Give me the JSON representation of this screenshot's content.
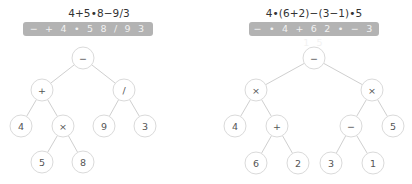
{
  "trees": [
    {
      "id": "left",
      "infix": "4+5•8−9/3",
      "prefix": "− + 4 • 5 8 / 9 3",
      "nodes": [
        {
          "id": "n0",
          "label": "−",
          "x": 83,
          "y": 58
        },
        {
          "id": "n1",
          "label": "+",
          "x": 42,
          "y": 90
        },
        {
          "id": "n2",
          "label": "/",
          "x": 124,
          "y": 90
        },
        {
          "id": "n3",
          "label": "4",
          "x": 21,
          "y": 126
        },
        {
          "id": "n4",
          "label": "×",
          "x": 63,
          "y": 126
        },
        {
          "id": "n5",
          "label": "9",
          "x": 104,
          "y": 126
        },
        {
          "id": "n6",
          "label": "3",
          "x": 145,
          "y": 126
        },
        {
          "id": "n7",
          "label": "5",
          "x": 42,
          "y": 162
        },
        {
          "id": "n8",
          "label": "8",
          "x": 83,
          "y": 162
        }
      ],
      "edges": [
        [
          "n0",
          "n1"
        ],
        [
          "n0",
          "n2"
        ],
        [
          "n1",
          "n3"
        ],
        [
          "n1",
          "n4"
        ],
        [
          "n2",
          "n5"
        ],
        [
          "n2",
          "n6"
        ],
        [
          "n4",
          "n7"
        ],
        [
          "n4",
          "n8"
        ]
      ]
    },
    {
      "id": "right",
      "infix": "4•(6+2)−(3−1)•5",
      "prefix": "− • 4 + 6 2 • − 3 1 5",
      "nodes": [
        {
          "id": "m0",
          "label": "−",
          "x": 314,
          "y": 58
        },
        {
          "id": "m1",
          "label": "×",
          "x": 256,
          "y": 90
        },
        {
          "id": "m2",
          "label": "×",
          "x": 372,
          "y": 90
        },
        {
          "id": "m3",
          "label": "4",
          "x": 235,
          "y": 126
        },
        {
          "id": "m4",
          "label": "+",
          "x": 277,
          "y": 126
        },
        {
          "id": "m5",
          "label": "−",
          "x": 351,
          "y": 126
        },
        {
          "id": "m6",
          "label": "5",
          "x": 393,
          "y": 126
        },
        {
          "id": "m7",
          "label": "6",
          "x": 256,
          "y": 163
        },
        {
          "id": "m8",
          "label": "2",
          "x": 298,
          "y": 163
        },
        {
          "id": "m9",
          "label": "3",
          "x": 331,
          "y": 163
        },
        {
          "id": "m10",
          "label": "1",
          "x": 373,
          "y": 163
        }
      ],
      "edges": [
        [
          "m0",
          "m1"
        ],
        [
          "m0",
          "m2"
        ],
        [
          "m1",
          "m3"
        ],
        [
          "m1",
          "m4"
        ],
        [
          "m2",
          "m5"
        ],
        [
          "m2",
          "m6"
        ],
        [
          "m4",
          "m7"
        ],
        [
          "m4",
          "m8"
        ],
        [
          "m5",
          "m9"
        ],
        [
          "m5",
          "m10"
        ]
      ]
    }
  ],
  "style": {
    "banner_color": "#b3b3b3",
    "node_border": "#dadada",
    "edge_color": "#cfcfcf"
  }
}
